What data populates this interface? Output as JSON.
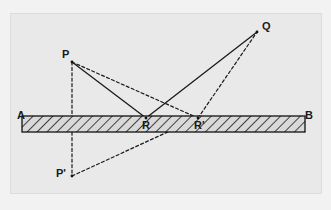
{
  "figure": {
    "background_color": "#e9e9e9",
    "outer_color": "#f2f2f2",
    "frame": {
      "x": 10,
      "y": 13,
      "width": 312,
      "height": 181,
      "border_color": "#dcdcdc"
    },
    "mirror": {
      "name": "mirror-bar",
      "left_label": "A",
      "right_label": "B",
      "x1": 22,
      "x2": 305,
      "top": 116,
      "bottom": 132,
      "fill": "#d8d8d8",
      "stroke": "#111111",
      "hatch_color": "#1a1a1a",
      "hatch_spacing": 7,
      "hatch_angle_deg": 45
    },
    "points": [
      {
        "id": "P",
        "label": "P",
        "x": 72,
        "y": 62,
        "label_x": 62,
        "label_y": 49,
        "type": "source"
      },
      {
        "id": "Q",
        "label": "Q",
        "x": 257,
        "y": 32,
        "label_x": 262,
        "label_y": 21,
        "type": "target"
      },
      {
        "id": "R",
        "label": "R",
        "x": 146,
        "y": 118,
        "label_x": 142,
        "label_y": 120,
        "type": "reflection-point"
      },
      {
        "id": "Rp",
        "label": "R'",
        "x": 198,
        "y": 118,
        "label_x": 194,
        "label_y": 120,
        "type": "reflection-point"
      },
      {
        "id": "Pp",
        "label": "P'",
        "x": 72,
        "y": 176,
        "label_x": 58,
        "label_y": 168,
        "type": "image-point"
      }
    ],
    "segments": [
      {
        "name": "ray-P-to-R",
        "from": "P",
        "to": "R",
        "style": "solid",
        "color": "#1a1a1a",
        "width": 1.3
      },
      {
        "name": "ray-R-to-Q",
        "from": "R",
        "to": "Q",
        "style": "solid",
        "color": "#1a1a1a",
        "width": 1.3
      },
      {
        "name": "ray-P-to-Rprime",
        "from": "P",
        "to": "Rp",
        "style": "dashed",
        "color": "#1a1a1a",
        "width": 1.2
      },
      {
        "name": "ray-Rprime-to-Q",
        "from": "Rp",
        "to": "Q",
        "style": "dashed",
        "color": "#1a1a1a",
        "width": 1.2
      },
      {
        "name": "perpendicular-P-to-Pprime",
        "from": "P",
        "to": "Pp",
        "style": "dashed",
        "color": "#1a1a1a",
        "width": 1.2
      },
      {
        "name": "image-ray-Pprime-to-Rprime",
        "from": "Pp",
        "to": "Rp",
        "style": "dashed",
        "color": "#1a1a1a",
        "width": 1.2
      }
    ],
    "dash_pattern": "3,2.4"
  },
  "chart_data": {
    "type": "diagram",
    "xlabel": "",
    "ylabel": "",
    "coordinate_space": {
      "width": 331,
      "height": 210,
      "origin": "top-left-pixels"
    },
    "nodes": [
      {
        "label": "A",
        "x": 22,
        "y": 116
      },
      {
        "label": "B",
        "x": 305,
        "y": 116
      },
      {
        "label": "P",
        "x": 72,
        "y": 62
      },
      {
        "label": "Q",
        "x": 257,
        "y": 32
      },
      {
        "label": "R",
        "x": 146,
        "y": 118
      },
      {
        "label": "R'",
        "x": 198,
        "y": 118
      },
      {
        "label": "P'",
        "x": 72,
        "y": 176
      }
    ],
    "edges": [
      {
        "from": "P",
        "to": "R",
        "style": "solid"
      },
      {
        "from": "R",
        "to": "Q",
        "style": "solid"
      },
      {
        "from": "P",
        "to": "R'",
        "style": "dashed"
      },
      {
        "from": "R'",
        "to": "Q",
        "style": "dashed"
      },
      {
        "from": "P",
        "to": "P'",
        "style": "dashed"
      },
      {
        "from": "P'",
        "to": "R'",
        "style": "dashed"
      }
    ],
    "annotations": [
      "Mirror surface AB drawn as a hatched horizontal bar",
      "Solid path P-R-Q is the actual reflected ray",
      "Dashed path P-R'-Q is an alternative longer path",
      "P' is the mirror image of P, vertically below P through the mirror",
      "Straight dashed line P'-R'-Q shows the image construction"
    ]
  }
}
